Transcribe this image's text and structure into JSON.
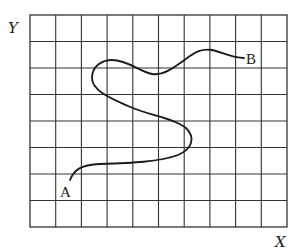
{
  "diagram": {
    "type": "grid-path",
    "axes": {
      "x_label": "X",
      "y_label": "Y"
    },
    "grid": {
      "columns": 10,
      "rows": 8,
      "left": 30,
      "top": 15,
      "cell_width": 25.7,
      "cell_height": 26.5,
      "line_color": "#333333"
    },
    "points": [
      {
        "id": "A",
        "label": "A",
        "role": "start"
      },
      {
        "id": "B",
        "label": "B",
        "role": "end"
      }
    ],
    "path": {
      "description": "winding curve from A (lower left) to B (upper right), looping right then left",
      "color": "#1a1a1a"
    }
  }
}
